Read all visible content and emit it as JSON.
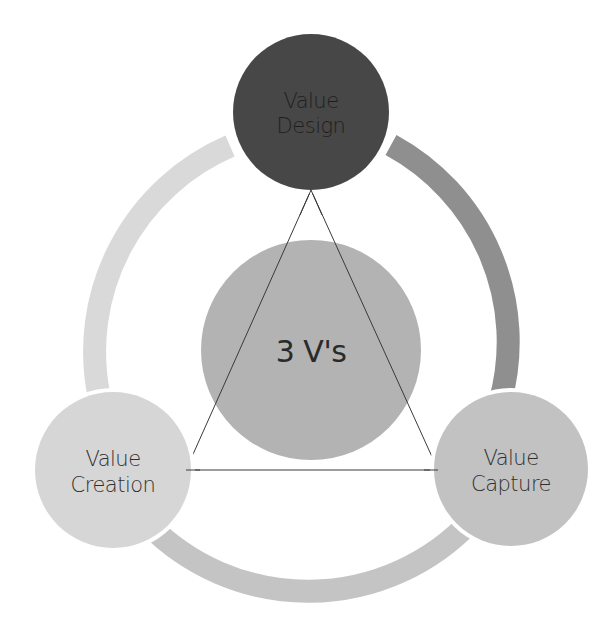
{
  "diagram": {
    "title": "3 V's",
    "center": {
      "label": "3 V's",
      "color": "#b3b3b3"
    },
    "nodes": [
      {
        "id": "value-design",
        "line1": "Value",
        "line2": "Design",
        "color": "#474747",
        "position": "top"
      },
      {
        "id": "value-creation",
        "line1": "Value",
        "line2": "Creation",
        "color": "#d6d6d6",
        "position": "bottom-left"
      },
      {
        "id": "value-capture",
        "line1": "Value",
        "line2": "Capture",
        "color": "#c2c2c2",
        "position": "bottom-right"
      }
    ],
    "ring_segments": [
      {
        "id": "design-to-capture",
        "color": "#8f8f8f"
      },
      {
        "id": "capture-to-creation",
        "color": "#c4c4c4"
      },
      {
        "id": "creation-to-design",
        "color": "#d9d9d9"
      }
    ],
    "connector": {
      "shape": "triangle",
      "color": "#3a3a3a"
    }
  }
}
